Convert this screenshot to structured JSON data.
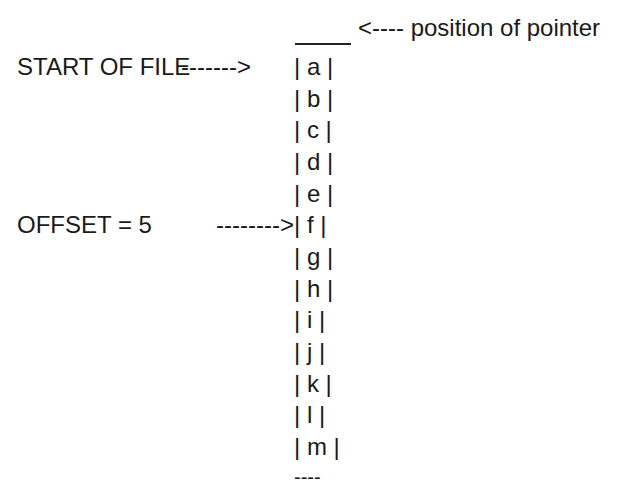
{
  "pointer_label": "<---- position of pointer",
  "start_label": "START OF FILE",
  "start_arrow": "------->",
  "offset_label": "OFFSET = 5",
  "offset_arrow": "-------->",
  "cells": [
    "| a |",
    "| b |",
    "| c |",
    "| d |",
    "| e |",
    "| f |",
    "| g |",
    "| h |",
    "| i |",
    "| j |",
    "| k |",
    "| l |",
    "| m |"
  ],
  "end_marker": "----"
}
